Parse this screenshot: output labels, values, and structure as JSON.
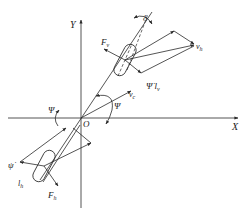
{
  "diagram": {
    "type": "vehicle single-track (bicycle) model",
    "axes": {
      "x_label": "X",
      "y_label": "Y",
      "origin_label": "O"
    },
    "labels": {
      "delta": "δ",
      "front_force": "F",
      "front_force_sub": "v",
      "front_velocity": "v",
      "front_velocity_sub": "h",
      "yaw_rate_front": "Ψ̇ l",
      "yaw_rate_front_sub": "v",
      "cg_velocity": "v",
      "cg_velocity_sub": "c",
      "psi_right": "Ψ",
      "psi_left": "Ψ",
      "yaw_rate_rear": "ψ̇",
      "rear_length": "l",
      "rear_length_sub": "h",
      "rear_force": "F",
      "rear_force_sub": "h"
    },
    "colors": {
      "line": "#2a2a2a",
      "text": "#222222",
      "background": "#ffffff"
    }
  }
}
